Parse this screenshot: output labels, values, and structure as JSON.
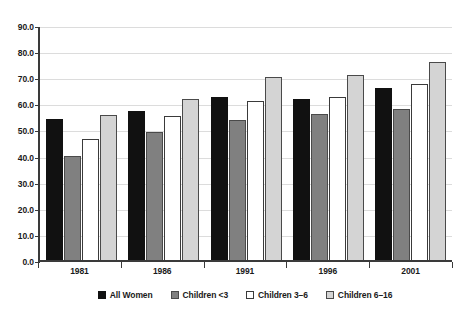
{
  "chart_data": {
    "type": "bar",
    "title": "",
    "xlabel": "",
    "ylabel": "",
    "ylim": [
      0.0,
      90.0
    ],
    "ytick_step": 10.0,
    "ytick_labels": [
      "90.0",
      "80.0",
      "70.0",
      "60.0",
      "50.0",
      "40.0",
      "30.0",
      "20.0",
      "10.0",
      "0.0"
    ],
    "ytick_values": [
      90.0,
      80.0,
      70.0,
      60.0,
      50.0,
      40.0,
      30.0,
      20.0,
      10.0,
      0.0
    ],
    "grid": true,
    "legend_position": "bottom",
    "categories": [
      "1981",
      "1986",
      "1991",
      "1996",
      "2001"
    ],
    "series": [
      {
        "name": "All Women",
        "color": "#111111",
        "values": [
          54.0,
          57.0,
          62.5,
          61.5,
          66.0
        ]
      },
      {
        "name": "Children <3",
        "color": "#808080",
        "values": [
          40.0,
          49.0,
          53.5,
          56.0,
          58.0
        ]
      },
      {
        "name": "Children 3–6",
        "color": "#ffffff",
        "values": [
          46.5,
          55.0,
          61.0,
          62.5,
          67.5
        ]
      },
      {
        "name": "Children 6–16",
        "color": "#d4d4d4",
        "values": [
          55.5,
          61.5,
          70.0,
          71.0,
          76.0
        ]
      }
    ]
  },
  "colors": {
    "axis": "#3a3a3a",
    "gridline": "#dcdcdc",
    "text": "#1a1a1a",
    "background": "#ffffff"
  }
}
